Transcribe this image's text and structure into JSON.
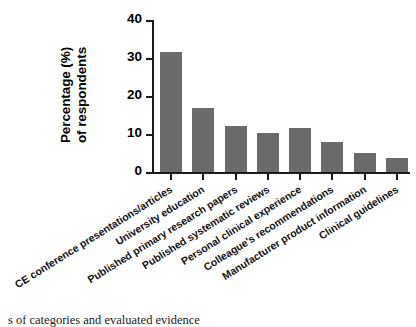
{
  "chart_data": {
    "type": "bar",
    "title": "",
    "xlabel": "",
    "ylabel": "Percentage (%) of respondents",
    "ylabel_lines": [
      "Percentage (%)",
      "of respondents"
    ],
    "ylim": [
      0,
      40
    ],
    "yticks": [
      0,
      10,
      20,
      30,
      40
    ],
    "ytick_labels": [
      "0",
      "10",
      "20",
      "30",
      "40"
    ],
    "grid": false,
    "legend": false,
    "bar_color": "#6b6b6b",
    "axis_color": "#1a1a1a",
    "categories": [
      "CE conference presentations/articles",
      "University education",
      "Published primary research papers",
      "Published systematic reviews",
      "Personal clinical experience",
      "Colleague's recommendations",
      "Manufacturer product information",
      "Clinical guidelines"
    ],
    "values": [
      31.5,
      16.8,
      12.1,
      10.3,
      11.7,
      7.9,
      5.0,
      3.7
    ]
  },
  "caption": {
    "text": "s of categories and evaluated evidence"
  }
}
